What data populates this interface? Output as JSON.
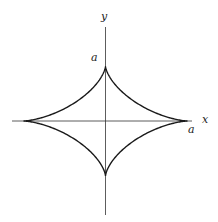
{
  "diagram": {
    "type": "astroid",
    "axes": {
      "x_label": "x",
      "y_label": "y"
    },
    "annotations": {
      "y_intercept_label": "a",
      "x_intercept_label": "a"
    },
    "colors": {
      "curve": "#1a1a1a",
      "axis": "#333333",
      "background": "#ffffff"
    }
  }
}
